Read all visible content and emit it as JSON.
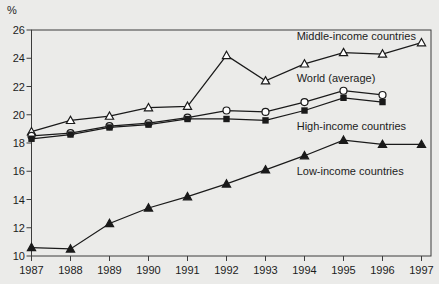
{
  "figure": {
    "background": "#ebebe9",
    "marker_fill": "#ffffff",
    "line_color": "#1a1a1a",
    "text_color": "#1c1c1c",
    "axis_color": "#3c3c3c"
  },
  "chart_data": {
    "type": "line",
    "title": "",
    "xlabel": "",
    "ylabel": "%",
    "x": [
      1987,
      1988,
      1989,
      1990,
      1991,
      1992,
      1993,
      1994,
      1995,
      1996,
      1997
    ],
    "x_tick_labels": [
      "1987",
      "1988",
      "1989",
      "1990",
      "1991",
      "1992",
      "1993",
      "1994",
      "1995",
      "1996",
      "1997"
    ],
    "ylim": [
      10,
      26
    ],
    "y_ticks": [
      10,
      12,
      14,
      16,
      18,
      20,
      22,
      24,
      26
    ],
    "y_tick_labels": [
      "10",
      "12",
      "14",
      "16",
      "18",
      "20",
      "22",
      "24",
      "26"
    ],
    "grid": false,
    "legend_position": "inline-annotations",
    "series": [
      {
        "name": "Middle-income countries",
        "marker": "triangle-open",
        "values": [
          18.8,
          19.6,
          19.9,
          20.5,
          20.6,
          24.2,
          22.4,
          23.6,
          24.4,
          24.3,
          25.1
        ]
      },
      {
        "name": "World (average)",
        "marker": "circle-open",
        "values": [
          18.5,
          18.7,
          19.2,
          19.4,
          19.8,
          20.3,
          20.2,
          20.9,
          21.7,
          21.4,
          null
        ]
      },
      {
        "name": "High-income countries",
        "marker": "square-filled",
        "values": [
          18.3,
          18.6,
          19.1,
          19.3,
          19.7,
          19.7,
          19.6,
          20.3,
          21.2,
          20.9,
          null
        ]
      },
      {
        "name": "Low-income countries",
        "marker": "triangle-filled",
        "values": [
          10.6,
          10.5,
          12.3,
          13.4,
          14.2,
          15.1,
          16.1,
          17.1,
          18.2,
          17.9,
          17.9
        ]
      }
    ],
    "annotations": [
      {
        "text": "Middle-income countries",
        "x": 1993.8,
        "y": 25.55
      },
      {
        "text": "World (average)",
        "x": 1993.8,
        "y": 22.6
      },
      {
        "text": "High-income countries",
        "x": 1993.8,
        "y": 19.2
      },
      {
        "text": "Low-income countries",
        "x": 1993.8,
        "y": 16.0
      }
    ]
  }
}
